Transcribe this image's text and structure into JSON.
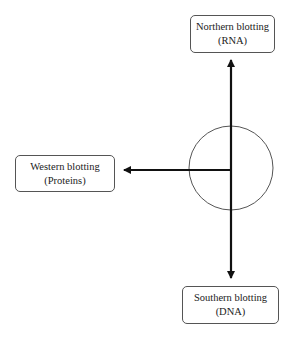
{
  "diagram": {
    "center": {
      "shape": "circle",
      "label": ""
    },
    "nodes": [
      {
        "id": "northern",
        "title": "Northern blotting",
        "subtitle": "(RNA)",
        "direction": "up"
      },
      {
        "id": "western",
        "title": "Western blotting",
        "subtitle": "(Proteins)",
        "direction": "left"
      },
      {
        "id": "southern",
        "title": "Southern blotting",
        "subtitle": "(DNA)",
        "direction": "down"
      }
    ],
    "colors": {
      "line": "#111111",
      "circle": "#555555",
      "box_border": "#555555",
      "text": "#222222"
    }
  }
}
